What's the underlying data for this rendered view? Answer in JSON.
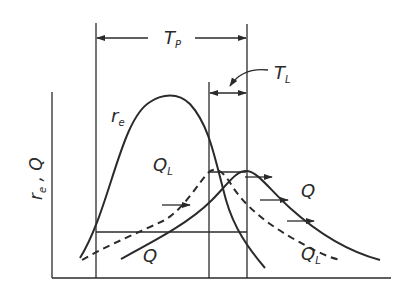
{
  "diagram": {
    "title": "",
    "y_axis_label": {
      "main1": "r",
      "sub1": "e",
      "sep": " , ",
      "main2": "Q"
    },
    "curves": [
      {
        "id": "re",
        "label_main": "r",
        "label_sub": "e",
        "style": "solid"
      },
      {
        "id": "QL_left",
        "label_main": "Q",
        "label_sub": "L",
        "style": "dashed"
      },
      {
        "id": "Q_left",
        "label_main": "Q",
        "label_sub": "",
        "style": "solid"
      },
      {
        "id": "Q_right",
        "label_main": "Q",
        "label_sub": "",
        "style": "solid"
      },
      {
        "id": "QL_right",
        "label_main": "Q",
        "label_sub": "L",
        "style": "dashed"
      }
    ],
    "dimensions": {
      "TP": {
        "main": "T",
        "sub": "P"
      },
      "TL": {
        "main": "T",
        "sub": "L"
      }
    },
    "colors": {
      "line": "#2a2a2a",
      "background": "#ffffff"
    }
  }
}
